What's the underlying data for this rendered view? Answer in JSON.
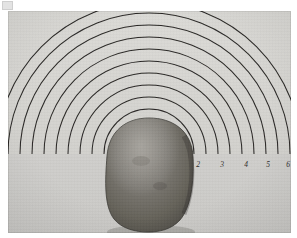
{
  "figure": {
    "kind": "photograph"
  },
  "background": {
    "page_color": "#ffffff",
    "print_upper_color": "#d8d7d3",
    "print_lower_color": "#cdccc9",
    "photo_left": 8,
    "photo_top": 11,
    "photo_width": 283,
    "photo_height": 222
  },
  "baseline": {
    "label": "horizontal-baseline",
    "color": "#2b2927",
    "y": 143,
    "x_start": 0,
    "x_end": 283
  },
  "arcs": {
    "label": "concentric-semicircle-arcs",
    "count": 10,
    "color": "#2a2826",
    "center_x": 141,
    "center_y": 143,
    "radii": [
      45,
      57,
      69,
      81,
      93,
      105,
      117,
      129,
      141,
      152
    ]
  },
  "object": {
    "label": "potato",
    "color": "#6e6b66",
    "shadow_color": "#454340",
    "center_x": 141,
    "top_y": 107,
    "width": 84,
    "height": 113
  },
  "scale": {
    "label": "radius-scale-ticks",
    "tick_labels": [
      "2",
      "3",
      "4",
      "5",
      "6"
    ],
    "tick_x": [
      190,
      214,
      238,
      260,
      280
    ],
    "tick_label_y": 156,
    "ticks_text_color": "#2e2c2a"
  },
  "artifact": {
    "label": "scan-corner-artifact",
    "color": "#e3e3e3"
  }
}
